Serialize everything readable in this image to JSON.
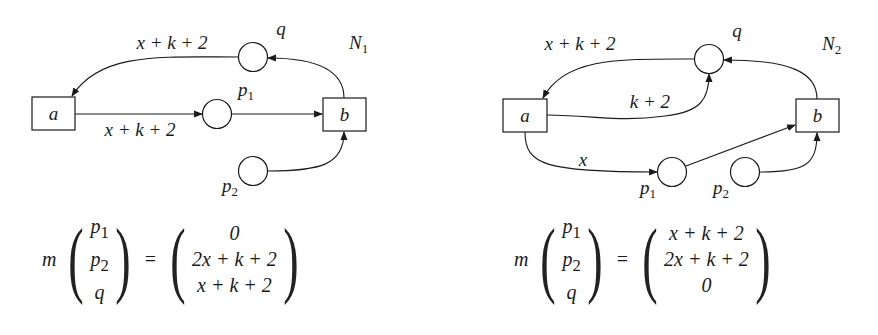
{
  "figure": {
    "nets": [
      {
        "name": "N_1",
        "name_base": "N",
        "name_sub": "1",
        "transitions": [
          {
            "id": "a",
            "label": "a"
          },
          {
            "id": "b",
            "label": "b"
          }
        ],
        "places": [
          {
            "id": "q",
            "label": "q"
          },
          {
            "id": "p1",
            "label_base": "p",
            "label_sub": "1"
          },
          {
            "id": "p2",
            "label_base": "p",
            "label_sub": "2"
          }
        ],
        "arcs": [
          {
            "from": "b",
            "to": "q",
            "weight": ""
          },
          {
            "from": "q",
            "to": "a",
            "weight": "x + k + 2"
          },
          {
            "from": "a",
            "to": "p1",
            "weight": "x + k + 2"
          },
          {
            "from": "p1",
            "to": "b",
            "weight": ""
          },
          {
            "from": "p2",
            "to": "b",
            "weight": ""
          }
        ],
        "equation": {
          "lhs_func": "m",
          "lhs_vector": [
            {
              "base": "p",
              "sub": "1"
            },
            {
              "base": "p",
              "sub": "2"
            },
            {
              "base": "q",
              "sub": ""
            }
          ],
          "equals": "=",
          "rhs_vector": [
            "0",
            "2x + k + 2",
            "x + k + 2"
          ]
        }
      },
      {
        "name": "N_2",
        "name_base": "N",
        "name_sub": "2",
        "transitions": [
          {
            "id": "a",
            "label": "a"
          },
          {
            "id": "b",
            "label": "b"
          }
        ],
        "places": [
          {
            "id": "q",
            "label": "q"
          },
          {
            "id": "p1",
            "label_base": "p",
            "label_sub": "1"
          },
          {
            "id": "p2",
            "label_base": "p",
            "label_sub": "2"
          }
        ],
        "arcs": [
          {
            "from": "b",
            "to": "q",
            "weight": ""
          },
          {
            "from": "q",
            "to": "a",
            "weight": "x + k + 2"
          },
          {
            "from": "a",
            "to": "q",
            "weight": "k + 2"
          },
          {
            "from": "a",
            "to": "p1",
            "weight": "x"
          },
          {
            "from": "p1",
            "to": "b",
            "weight": ""
          },
          {
            "from": "p2",
            "to": "b",
            "weight": ""
          }
        ],
        "equation": {
          "lhs_func": "m",
          "lhs_vector": [
            {
              "base": "p",
              "sub": "1"
            },
            {
              "base": "p",
              "sub": "2"
            },
            {
              "base": "q",
              "sub": ""
            }
          ],
          "equals": "=",
          "rhs_vector": [
            "x + k + 2",
            "2x + k + 2",
            "0"
          ]
        }
      }
    ]
  }
}
